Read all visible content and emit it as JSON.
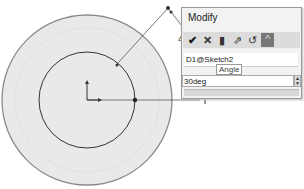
{
  "dialog": {
    "title": "Modify",
    "toolbar": [
      {
        "name": "ok-check-icon",
        "glyph": "✔"
      },
      {
        "name": "cancel-x-icon",
        "glyph": "✕"
      },
      {
        "name": "rebuild-icon",
        "glyph": "▮"
      },
      {
        "name": "reset-spin-icon",
        "glyph": "⇗"
      },
      {
        "name": "reverse-sense-icon",
        "glyph": "↺"
      },
      {
        "name": "mark-dimension-icon",
        "glyph": "^"
      }
    ],
    "dimension_name": "D1@Sketch2",
    "tooltip": "Angle",
    "value": "30deg",
    "spinner_up": "▲",
    "spinner_down": "▼"
  },
  "cursor_label": "4"
}
